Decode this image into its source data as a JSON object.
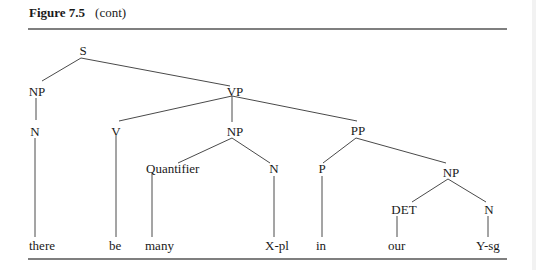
{
  "title": {
    "figure": "Figure 7.5",
    "subtitle": "(cont)"
  },
  "tree": {
    "nodes": {
      "S": "S",
      "NP1": "NP",
      "VP": "VP",
      "N1": "N",
      "V": "V",
      "NP2": "NP",
      "PP": "PP",
      "Quantifier": "Quantifier",
      "N2": "N",
      "P": "P",
      "NP3": "NP",
      "DET": "DET",
      "N3": "N"
    },
    "leaves": {
      "there": "there",
      "be": "be",
      "many": "many",
      "Xpl": "X-pl",
      "in": "in",
      "our": "our",
      "Ysg": "Y-sg"
    },
    "edges": [
      [
        "S",
        "NP"
      ],
      [
        "S",
        "VP"
      ],
      [
        "NP",
        "N"
      ],
      [
        "N",
        "there"
      ],
      [
        "VP",
        "V"
      ],
      [
        "VP",
        "NP"
      ],
      [
        "VP",
        "PP"
      ],
      [
        "V",
        "be"
      ],
      [
        "NP",
        "Quantifier"
      ],
      [
        "NP",
        "N"
      ],
      [
        "Quantifier",
        "many"
      ],
      [
        "N",
        "X-pl"
      ],
      [
        "PP",
        "P"
      ],
      [
        "PP",
        "NP"
      ],
      [
        "P",
        "in"
      ],
      [
        "NP",
        "DET"
      ],
      [
        "NP",
        "N"
      ],
      [
        "DET",
        "our"
      ],
      [
        "N",
        "Y-sg"
      ]
    ]
  }
}
